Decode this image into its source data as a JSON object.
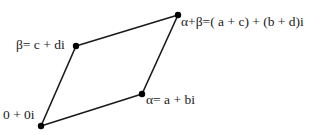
{
  "diagram": {
    "type": "parallelogram-complex-addition",
    "line_color": "#1a1a1a",
    "point_color": "#000000",
    "vertices": [
      {
        "id": "origin",
        "x": 41,
        "y": 126,
        "label": "0 + 0i"
      },
      {
        "id": "alpha",
        "x": 142,
        "y": 94,
        "label": "α= a + bi"
      },
      {
        "id": "sum",
        "x": 178,
        "y": 15,
        "label": "α+β=( a + c) + (b + d)i"
      },
      {
        "id": "beta",
        "x": 76,
        "y": 46,
        "label": "β= c + di"
      }
    ],
    "edges": [
      [
        "origin",
        "alpha"
      ],
      [
        "alpha",
        "sum"
      ],
      [
        "sum",
        "beta"
      ],
      [
        "beta",
        "origin"
      ]
    ]
  }
}
